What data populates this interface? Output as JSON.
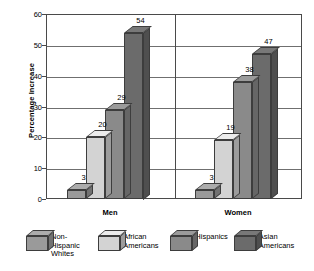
{
  "chart_data": {
    "type": "bar",
    "title": "",
    "xlabel": "",
    "ylabel": "Percentage Increase",
    "ylim": [
      0,
      60
    ],
    "yticks": [
      0,
      10,
      20,
      30,
      40,
      50,
      60
    ],
    "grid": true,
    "legend_position": "bottom",
    "categories": [
      "Men",
      "Women"
    ],
    "series": [
      {
        "name": "Non-Hispanic Whites",
        "values": [
          3,
          3
        ],
        "color": "#9a9a9a"
      },
      {
        "name": "African Americans",
        "values": [
          20,
          19
        ],
        "color": "#d3d3d3"
      },
      {
        "name": "Hispanics",
        "values": [
          29,
          38
        ],
        "color": "#8a8a8a"
      },
      {
        "name": "Asian Americans",
        "values": [
          54,
          47
        ],
        "color": "#6b6b6b"
      }
    ]
  },
  "axis": {
    "y_title": "Percentage Increase",
    "y_ticks": [
      "0",
      "10",
      "20",
      "30",
      "40",
      "50",
      "60"
    ]
  },
  "groups": [
    {
      "label": "Men"
    },
    {
      "label": "Women"
    }
  ],
  "bars": [
    {
      "group": "Men",
      "series": "Non-Hispanic Whites",
      "value": 3,
      "label": "3"
    },
    {
      "group": "Men",
      "series": "African Americans",
      "value": 20,
      "label": "20"
    },
    {
      "group": "Men",
      "series": "Hispanics",
      "value": 29,
      "label": "29"
    },
    {
      "group": "Men",
      "series": "Asian Americans",
      "value": 54,
      "label": "54"
    },
    {
      "group": "Women",
      "series": "Non-Hispanic Whites",
      "value": 3,
      "label": "3"
    },
    {
      "group": "Women",
      "series": "African Americans",
      "value": 19,
      "label": "19"
    },
    {
      "group": "Women",
      "series": "Hispanics",
      "value": 38,
      "label": "38"
    },
    {
      "group": "Women",
      "series": "Asian Americans",
      "value": 47,
      "label": "47"
    }
  ],
  "legend": [
    {
      "label": "Non-Hispanic Whites",
      "color": "#9a9a9a"
    },
    {
      "label": "African Americans",
      "color": "#d3d3d3"
    },
    {
      "label": "Hispanics",
      "color": "#8a8a8a"
    },
    {
      "label": "Asian Americans",
      "color": "#6b6b6b"
    }
  ],
  "colors": {
    "axis": "#4a4a4a",
    "grid": "#6f6f6f",
    "background": "#ffffff",
    "text": "#000000"
  }
}
